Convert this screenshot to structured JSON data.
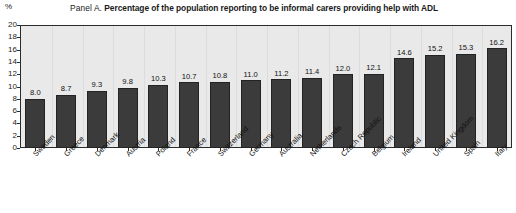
{
  "header": {
    "panel_prefix": "Panel A.",
    "title": "Percentage of the population reporting to be informal carers providing help with ADL",
    "unit": "%"
  },
  "colors": {
    "bar_fill": "#3b3b3b",
    "bar_stroke": "#232323",
    "plot_background": "#e9e9e9",
    "axis": "#2b2b2b",
    "gridline": "#dcdcdc"
  },
  "chart_data": {
    "type": "bar",
    "title": "Panel A. Percentage of the population reporting to be informal carers providing help with ADL",
    "xlabel": "",
    "ylabel": "%",
    "ylim": [
      0,
      20
    ],
    "yticks": [
      0,
      2,
      4,
      6,
      8,
      10,
      12,
      14,
      16,
      18,
      20
    ],
    "ytick_labels": [
      "0",
      "2",
      "4",
      "6",
      "8",
      "10",
      "12",
      "14",
      "16",
      "18",
      "20"
    ],
    "grid": "vertical-faint",
    "legend": "none",
    "data_labels": true,
    "categories": [
      "Sweden",
      "Greece",
      "Denmark",
      "Austria",
      "Poland",
      "France",
      "Switzerland",
      "Germany",
      "Australia",
      "Netherlands",
      "Czech Republic",
      "Belgium",
      "Ireland",
      "United Kingdom",
      "Spain",
      "Italy"
    ],
    "values": [
      8.0,
      8.7,
      9.3,
      9.8,
      10.3,
      10.7,
      10.8,
      11.0,
      11.2,
      11.4,
      12.0,
      12.1,
      14.6,
      15.2,
      15.3,
      16.2
    ],
    "value_labels": [
      "8.0",
      "8.7",
      "9.3",
      "9.8",
      "10.3",
      "10.7",
      "10.8",
      "11.0",
      "11.2",
      "11.4",
      "12.0",
      "12.1",
      "14.6",
      "15.2",
      "15.3",
      "16.2"
    ]
  }
}
